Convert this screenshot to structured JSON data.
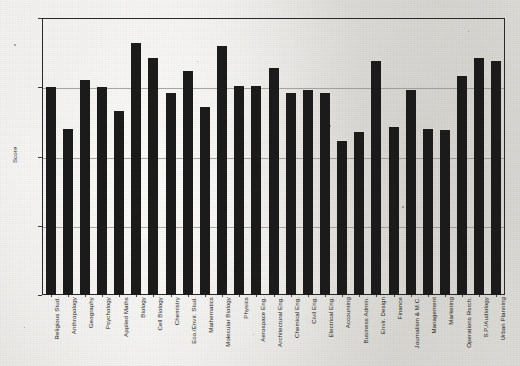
{
  "chart_data": {
    "type": "bar",
    "title": "",
    "xlabel": "",
    "ylabel": "Score",
    "ylim": [
      3.0,
      5.0
    ],
    "ytick_labels": [
      "5.00",
      "4.50",
      "4.00",
      "3.50",
      "3.00"
    ],
    "yticks": [
      5.0,
      4.5,
      4.0,
      3.5,
      3.0
    ],
    "grid": true,
    "legend": "none",
    "bar_color": "#1b1b1b",
    "categories": [
      "Religious Stud.",
      "Anthropology",
      "Geography",
      "Psychology",
      "Applied Maths",
      "Biology",
      "Cell Biology",
      "Chemistry",
      "Eco./Envir. Stud.",
      "Mathematics",
      "Molecular Biology",
      "Physics",
      "Aerospace Eng.",
      "Architectural Eng.",
      "Chemical Eng.",
      "Civil Eng.",
      "Electrical Eng.",
      "Accounting",
      "Business Admin.",
      "Envir. Design",
      "Finance",
      "Journalism & M.C.",
      "Management",
      "Marketing",
      "Operations Rsrch.",
      "S.P./Audiology",
      "Urban Planning"
    ],
    "values": [
      4.5,
      4.2,
      4.55,
      4.5,
      4.33,
      4.82,
      4.71,
      4.46,
      4.62,
      4.36,
      4.8,
      4.51,
      4.51,
      4.64,
      4.46,
      4.48,
      4.46,
      4.11,
      4.18,
      4.69,
      4.21,
      4.48,
      4.2,
      4.19,
      4.58,
      4.71,
      4.69
    ]
  },
  "axis": {
    "y_title": "Score"
  }
}
